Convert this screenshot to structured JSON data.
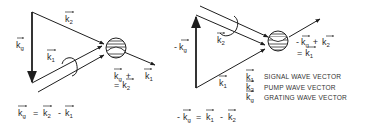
{
  "left_diagram": {
    "labels": {
      "kg": {
        "base": "k",
        "sub": "g"
      },
      "k2": {
        "base": "k",
        "sub": "2"
      },
      "k1": {
        "base": "k",
        "sub": "1"
      },
      "k1_out": {
        "base": "k",
        "sub": "1"
      },
      "sum_line1": {
        "base": "k",
        "sub": "g",
        "op": "+"
      },
      "sum_line2": {
        "prefix": "=",
        "base": "k",
        "sub": "2"
      }
    },
    "equation": {
      "lhs": {
        "base": "k",
        "sub": "g"
      },
      "eq": "=",
      "t1": {
        "base": "k",
        "sub": "2"
      },
      "minus": "-",
      "t2": {
        "base": "k",
        "sub": "1"
      }
    }
  },
  "right_diagram": {
    "labels": {
      "neg_kg": {
        "prefix": "-",
        "base": "k",
        "sub": "g"
      },
      "k2": {
        "base": "k",
        "sub": "2"
      },
      "k1": {
        "base": "k",
        "sub": "1"
      },
      "sum_line1": {
        "prefix": "-",
        "base": "k",
        "sub": "g",
        "op": "+",
        "base2": "k",
        "sub2": "2"
      },
      "sum_line2": {
        "prefix": "=",
        "base": "k",
        "sub": "1"
      }
    },
    "equation": {
      "prefix": "-",
      "lhs": {
        "base": "k",
        "sub": "g"
      },
      "eq": "=",
      "t1": {
        "base": "k",
        "sub": "1"
      },
      "minus": "-",
      "t2": {
        "base": "k",
        "sub": "2"
      }
    }
  },
  "legend": [
    {
      "symbol": {
        "base": "k",
        "sub": "1"
      },
      "text": "SIGNAL WAVE VECTOR"
    },
    {
      "symbol": {
        "base": "k",
        "sub": "2"
      },
      "text": "PUMP WAVE VECTOR"
    },
    {
      "symbol": {
        "base": "k",
        "sub": "g"
      },
      "text": "GRATING WAVE VECTOR"
    }
  ],
  "colors": {
    "ink": "#1e1e1e",
    "background": "#ffffff"
  }
}
